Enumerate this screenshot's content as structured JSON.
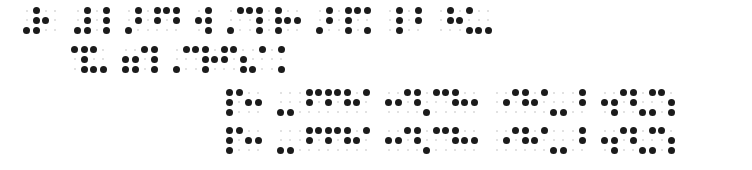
{
  "document": {
    "kind": "braille-transcription",
    "script": "Braille",
    "page_background": "#ffffff",
    "ink_color": "#1b1b1b",
    "faint_dot_color": "#d8d8d8",
    "line_count": 4,
    "cell_width_px": 19,
    "cell_height_px": 29,
    "dot_diameter_px": 7,
    "word_gap_px": 13,
    "lines": [
      {
        "id": "line-1",
        "x": 22,
        "y": 6,
        "words": [
          {
            "id": "line-1-word-1",
            "cells": [
              {
                "dots": [
                  3,
                  4,
                  5,
                  6
                ]
              },
              {
                "dots": [
                  2
                ]
              }
            ]
          },
          {
            "id": "line-1-word-2",
            "cells": [
              {
                "dots": [
                  3,
                  4,
                  5,
                  6
                ]
              },
              {
                "dots": [
                  4,
                  5,
                  6
                ]
              }
            ]
          },
          {
            "id": "line-1-word-3",
            "cells": [
              {
                "dots": [
                  3,
                  4,
                  5
                ]
              },
              {
                "dots": [
                  4,
                  5
                ]
              },
              {
                "dots": [
                  1,
                  4,
                  5
                ]
              }
            ]
          },
          {
            "id": "line-1-word-4",
            "cells": [
              {
                "dots": [
                  2,
                  4,
                  5,
                  6
                ]
              }
            ]
          },
          {
            "id": "line-1-word-5",
            "cells": [
              {
                "dots": [
                  3,
                  4
                ]
              },
              {
                "dots": [
                  1,
                  4,
                  5,
                  6
                ]
              },
              {
                "dots": [
                  4,
                  5,
                  6
                ]
              },
              {
                "dots": [
                  2,
                  5
                ]
              }
            ]
          },
          {
            "id": "line-1-word-6",
            "cells": [
              {
                "dots": [
                  3,
                  4,
                  5
                ]
              },
              {
                "dots": [
                  4,
                  5,
                  6
                ]
              },
              {
                "dots": [
                  1,
                  4,
                  6
                ]
              }
            ]
          },
          {
            "id": "line-1-word-7",
            "cells": [
              {
                "dots": [
                  4,
                  5,
                  6
                ]
              },
              {
                "dots": [
                  4,
                  5
                ]
              }
            ]
          },
          {
            "id": "line-1-word-8",
            "cells": [
              {
                "dots": [
                  4,
                  5
                ]
              },
              {
                "dots": [
                  2,
                  4,
                  6
                ]
              },
              {
                "dots": [
                  3,
                  6
                ]
              }
            ]
          }
        ]
      },
      {
        "id": "line-2",
        "x": 70,
        "y": 45,
        "words": [
          {
            "id": "line-2-word-1",
            "cells": [
              {
                "dots": [
                  1,
                  4,
                  5,
                  6
                ]
              },
              {
                "dots": [
                  1,
                  3,
                  6
                ]
              }
            ]
          },
          {
            "id": "line-2-word-2",
            "cells": [
              {
                "dots": [
                  2,
                  3,
                  5,
                  6
                ]
              },
              {
                "dots": [
                  1,
                  4,
                  5,
                  6
                ]
              }
            ]
          },
          {
            "id": "line-2-word-3",
            "cells": [
              {
                "dots": [
                  3,
                  4
                ]
              },
              {
                "dots": [
                  1,
                  4,
                  5,
                  6
                ]
              },
              {
                "dots": [
                  2,
                  4,
                  5
                ]
              },
              {
                "dots": [
                  1,
                  5,
                  6
                ]
              },
              {
                "dots": [
                  3,
                  4
                ]
              },
              {
                "dots": [
                  4,
                  6
                ]
              }
            ]
          }
        ]
      },
      {
        "id": "line-3",
        "x": 225,
        "y": 88,
        "words": [
          {
            "id": "line-3-word-1",
            "cells": [
              {
                "dots": [
                  1,
                  2,
                  3,
                  4
                ]
              },
              {
                "dots": [
                  2,
                  5
                ]
              }
            ]
          },
          {
            "id": "line-3-word-2",
            "cells": [
              {
                "dots": [
                  3,
                  6
                ]
              },
              {
                "dots": [
                  4,
                  5
                ]
              },
              {
                "dots": [
                  1,
                  4,
                  5
                ]
              },
              {
                "dots": [
                  1,
                  4,
                  5
                ]
              },
              {
                "dots": [
                  2,
                  4
                ]
              }
            ]
          },
          {
            "id": "line-3-word-3",
            "cells": [
              {
                "dots": [
                  2,
                  5
                ]
              },
              {
                "dots": [
                  1,
                  4,
                  5
                ]
              },
              {
                "dots": [
                  3,
                  4
                ]
              },
              {
                "dots": [
                  1,
                  4,
                  5
                ]
              },
              {
                "dots": [
                  2,
                  5
                ]
              }
            ]
          },
          {
            "id": "line-3-word-4",
            "cells": [
              {
                "dots": [
                  5
                ]
              },
              {
                "dots": [
                  1,
                  4,
                  5
                ]
              },
              {
                "dots": [
                  2,
                  4
                ]
              },
              {
                "dots": [
                  3,
                  6
                ]
              },
              {
                "dots": [
                  4,
                  5
                ]
              }
            ]
          },
          {
            "id": "line-3-word-5",
            "cells": [
              {
                "dots": [
                  2,
                  5,
                  6
                ]
              },
              {
                "dots": [
                  1,
                  4,
                  5
                ]
              },
              {
                "dots": [
                  3,
                  4,
                  6
                ]
              },
              {
                "dots": [
                  1,
                  5,
                  6
                ]
              }
            ]
          }
        ]
      },
      {
        "id": "line-4",
        "x": 225,
        "y": 126,
        "words": [
          {
            "id": "line-4-word-1",
            "cells": [
              {
                "dots": [
                  1,
                  2,
                  3,
                  4
                ]
              },
              {
                "dots": [
                  2,
                  5
                ]
              }
            ]
          },
          {
            "id": "line-4-word-2",
            "cells": [
              {
                "dots": [
                  3,
                  6
                ]
              },
              {
                "dots": [
                  4,
                  5
                ]
              },
              {
                "dots": [
                  1,
                  4,
                  5
                ]
              },
              {
                "dots": [
                  1,
                  4,
                  5
                ]
              },
              {
                "dots": [
                  2,
                  4
                ]
              }
            ]
          },
          {
            "id": "line-4-word-3",
            "cells": [
              {
                "dots": [
                  2,
                  5
                ]
              },
              {
                "dots": [
                  1,
                  4,
                  5
                ]
              },
              {
                "dots": [
                  3,
                  4
                ]
              },
              {
                "dots": [
                  1,
                  4,
                  5
                ]
              },
              {
                "dots": [
                  2,
                  5
                ]
              }
            ]
          },
          {
            "id": "line-4-word-4",
            "cells": [
              {
                "dots": [
                  5
                ]
              },
              {
                "dots": [
                  1,
                  4,
                  5
                ]
              },
              {
                "dots": [
                  2,
                  4
                ]
              },
              {
                "dots": [
                  3,
                  6
                ]
              },
              {
                "dots": [
                  4,
                  5
                ]
              }
            ]
          },
          {
            "id": "line-4-word-5",
            "cells": [
              {
                "dots": [
                  2,
                  5,
                  6
                ]
              },
              {
                "dots": [
                  1,
                  4,
                  5
                ]
              },
              {
                "dots": [
                  3,
                  4,
                  6
                ]
              },
              {
                "dots": [
                  1,
                  5,
                  6
                ]
              }
            ]
          }
        ]
      }
    ]
  }
}
